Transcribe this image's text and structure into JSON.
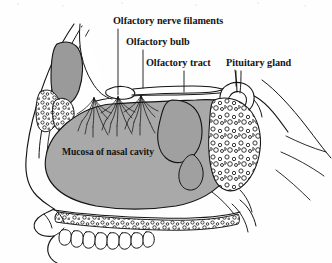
{
  "figure": {
    "type": "anatomical-line-diagram",
    "orientation": "left-lateral sagittal section",
    "background_color": "#fefefe",
    "ink_color": "#141414"
  },
  "labels": {
    "olfactory_nerve_filaments": "Olfactory nerve filaments",
    "olfactory_bulb": "Olfactory bulb",
    "olfactory_tract": "Olfactory tract",
    "pituitary_gland": "Pituitary gland",
    "mucosa_of_nasal_cavity": "Mucosa of nasal cavity"
  },
  "leader_lines": [
    {
      "label": "olfactory-nerve-filaments",
      "from_x": 118,
      "from_y": 29,
      "to_x": 118,
      "to_y": 95
    },
    {
      "label": "olfactory-bulb",
      "from_x": 143,
      "from_y": 50,
      "to_x": 143,
      "to_y": 88
    },
    {
      "label": "olfactory-tract",
      "from_x": 184,
      "from_y": 71,
      "to_x": 184,
      "to_y": 92
    },
    {
      "label": "pituitary-gland",
      "from_x": 236,
      "from_y": 71,
      "to_x": 236,
      "to_y": 86
    }
  ],
  "structures": [
    {
      "name": "nasal-mucosa",
      "fill": "#a9a9a9",
      "stroke": "#141414"
    },
    {
      "name": "superior-concha-bone",
      "fill": "#999999",
      "stroke": "#141414"
    },
    {
      "name": "middle-concha",
      "fill": "#a0a0a0",
      "stroke": "#141414"
    },
    {
      "name": "brain-frontal-lobe",
      "fill": "#ffffff",
      "stroke": "#141414"
    },
    {
      "name": "olfactory-bulb",
      "fill": "#ffffff",
      "stroke": "#141414"
    },
    {
      "name": "olfactory-tract",
      "fill": "#ffffff",
      "stroke": "#141414"
    },
    {
      "name": "pituitary-gland",
      "fill": "#ffffff",
      "stroke": "#141414"
    },
    {
      "name": "sphenoid-sinus",
      "fill": "#ffffff",
      "stroke": "#141414"
    },
    {
      "name": "diploe-bone-texture",
      "fill": "#ffffff",
      "stroke": "#141414"
    },
    {
      "name": "hard-palate",
      "fill": "#ffffff",
      "stroke": "#141414"
    },
    {
      "name": "teeth",
      "fill": "#ffffff",
      "stroke": "#141414"
    },
    {
      "name": "nerve-filament-bundles",
      "count": 3,
      "stroke": "#141414"
    }
  ],
  "colors": {
    "mucosa_gray": "#a9a9a9",
    "bone_gray": "#999999",
    "outline_black": "#141414",
    "paper_white": "#fefefe"
  }
}
